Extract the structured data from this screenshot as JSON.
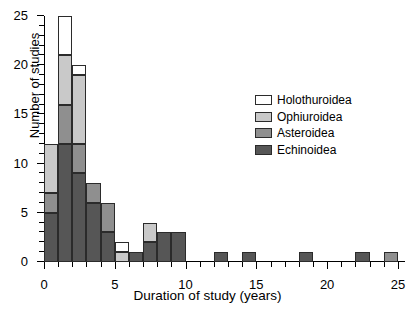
{
  "chart_data": {
    "type": "bar",
    "title": "",
    "xlabel": "Duration of study (years)",
    "ylabel": "Number of studies",
    "xlim": [
      0,
      25.5
    ],
    "ylim": [
      0,
      25
    ],
    "xticks": [
      0,
      5,
      10,
      15,
      20,
      25
    ],
    "xtick_labels": [
      "0",
      "5",
      "10",
      "15",
      "20",
      "25"
    ],
    "xtick_minor_step": 1,
    "yticks": [
      0,
      5,
      10,
      15,
      20,
      25
    ],
    "ytick_labels": [
      "0",
      "5",
      "10",
      "15",
      "20",
      "25"
    ],
    "ytick_minor_step": 1,
    "grid": false,
    "stacked": true,
    "bin_width": 1,
    "legend_position": "upper right",
    "legend_entries": [
      {
        "name": "Holothuroidea",
        "color": "#ffffff"
      },
      {
        "name": "Ophiuroidea",
        "color": "#c9c9c9"
      },
      {
        "name": "Asteroidea",
        "color": "#8f8f8f"
      },
      {
        "name": "Echinoidea",
        "color": "#565656"
      }
    ],
    "series": [
      {
        "name": "Echinoidea",
        "color": "#565656",
        "values": [
          5,
          12,
          9,
          6,
          3,
          0,
          1,
          2,
          3,
          3,
          0,
          0,
          1,
          0,
          1,
          0,
          0,
          0,
          1,
          0,
          0,
          0,
          1,
          0,
          0
        ]
      },
      {
        "name": "Asteroidea",
        "color": "#8f8f8f",
        "values": [
          2,
          4,
          3,
          2,
          3,
          0,
          0,
          0,
          0,
          0,
          0,
          0,
          0,
          0,
          0,
          0,
          0,
          0,
          0,
          0,
          0,
          0,
          0,
          0,
          1
        ]
      },
      {
        "name": "Ophiuroidea",
        "color": "#c9c9c9",
        "values": [
          5,
          5,
          7,
          0,
          0,
          1,
          0,
          2,
          0,
          0,
          0,
          0,
          0,
          0,
          0,
          0,
          0,
          0,
          0,
          0,
          0,
          0,
          0,
          0,
          0
        ]
      },
      {
        "name": "Holothuroidea",
        "color": "#ffffff",
        "values": [
          0,
          4,
          1,
          0,
          0,
          1,
          0,
          0,
          0,
          0,
          0,
          0,
          0,
          0,
          0,
          0,
          0,
          0,
          0,
          0,
          0,
          0,
          0,
          0,
          0
        ]
      }
    ],
    "bin_starts": [
      0,
      1,
      2,
      3,
      4,
      5,
      6,
      7,
      8,
      9,
      10,
      11,
      12,
      13,
      14,
      15,
      16,
      17,
      18,
      19,
      20,
      21,
      22,
      23,
      24
    ],
    "bin_totals": [
      12,
      25,
      20,
      8,
      6,
      2,
      1,
      4,
      3,
      3,
      0,
      0,
      1,
      0,
      1,
      0,
      0,
      0,
      1,
      0,
      0,
      0,
      1,
      0,
      1
    ]
  }
}
